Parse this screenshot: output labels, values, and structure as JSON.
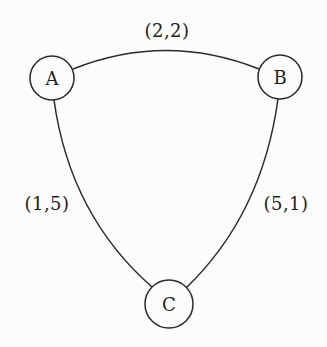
{
  "graph": {
    "colors": {
      "stroke": "#2a2a2a",
      "text": "#1e1e1e",
      "background": "#fcfcfc"
    },
    "nodes": [
      {
        "id": "A",
        "label": "A",
        "cx": 52,
        "cy": 78,
        "r": 22
      },
      {
        "id": "B",
        "label": "B",
        "cx": 280,
        "cy": 77,
        "r": 22
      },
      {
        "id": "C",
        "label": "C",
        "cx": 169,
        "cy": 304,
        "r": 24
      }
    ],
    "edges": [
      {
        "from": "A",
        "to": "B",
        "label": "(2,2)",
        "label_x": 167,
        "label_y": 31
      },
      {
        "from": "A",
        "to": "C",
        "label": "(1,5)",
        "label_x": 47,
        "label_y": 204
      },
      {
        "from": "B",
        "to": "C",
        "label": "(5,1)",
        "label_x": 286,
        "label_y": 204
      }
    ]
  }
}
